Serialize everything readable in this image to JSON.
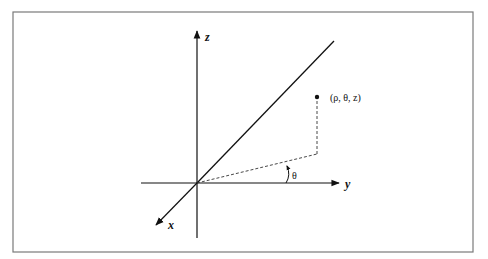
{
  "diagram": {
    "frame": {
      "x": 13,
      "y": 12,
      "width": 460,
      "height": 240,
      "stroke": "#7a7a7a"
    },
    "origin": {
      "x": 197,
      "y": 183
    },
    "axes": {
      "z": {
        "label": "z",
        "from": [
          197,
          238
        ],
        "to": [
          197,
          30
        ]
      },
      "y": {
        "label": "y",
        "from": [
          141,
          183
        ],
        "to": [
          340,
          183
        ]
      },
      "x": {
        "label": "x",
        "from": [
          197,
          183
        ],
        "to": [
          155,
          226
        ]
      }
    },
    "reference_line": {
      "from": [
        197,
        183
      ],
      "to": [
        334,
        41
      ]
    },
    "point": {
      "label": "(ρ, θ, z)",
      "x": 317,
      "y": 97
    },
    "projection": {
      "corner": [
        317,
        154
      ]
    },
    "angle": {
      "label": "θ"
    },
    "colors": {
      "line": "#111111",
      "dash": "#333333",
      "background": "#ffffff"
    }
  }
}
